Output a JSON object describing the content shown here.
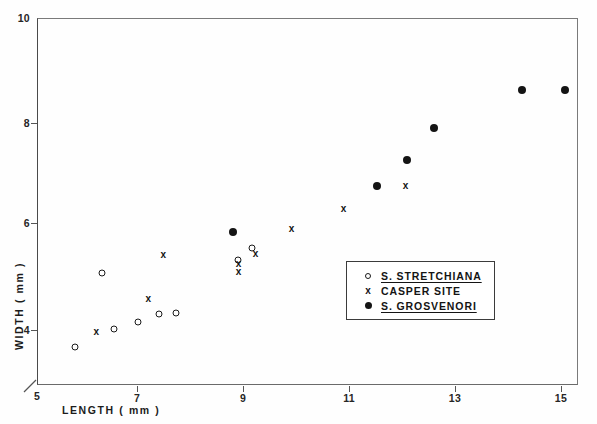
{
  "chart_data": {
    "type": "scatter",
    "title": "",
    "xlabel": "LENGTH ( mm )",
    "ylabel": "WIDTH ( mm )",
    "xlim": [
      5,
      15.2
    ],
    "ylim": [
      3.15,
      10
    ],
    "xticks": [
      5,
      7,
      9,
      11,
      13,
      15
    ],
    "yticks": [
      4,
      6,
      8,
      10
    ],
    "xtick_labels": [
      "5",
      "7",
      "9",
      "11",
      "13",
      "15"
    ],
    "ytick_labels": [
      "4",
      "6",
      "8",
      "10"
    ],
    "grid": false,
    "legend_position": "center-right",
    "series": [
      {
        "name": "S. STRETCHIANA",
        "marker": "open-circle",
        "underline": true,
        "points": [
          [
            5.72,
            3.86
          ],
          [
            6.22,
            5.25
          ],
          [
            6.45,
            4.2
          ],
          [
            6.9,
            4.32
          ],
          [
            7.3,
            4.48
          ],
          [
            7.62,
            4.5
          ],
          [
            8.78,
            5.48
          ],
          [
            9.05,
            5.7
          ]
        ]
      },
      {
        "name": "CASPER SITE",
        "marker": "cross",
        "underline": false,
        "points": [
          [
            6.12,
            4.15
          ],
          [
            7.38,
            5.6
          ],
          [
            7.1,
            4.78
          ],
          [
            8.8,
            5.42
          ],
          [
            8.8,
            5.28
          ],
          [
            9.12,
            5.62
          ],
          [
            9.8,
            6.08
          ],
          [
            10.78,
            6.45
          ],
          [
            11.95,
            6.88
          ]
        ]
      },
      {
        "name": "S. GROSVENORI",
        "marker": "filled-circle",
        "underline": true,
        "points": [
          [
            8.7,
            6.0
          ],
          [
            11.4,
            6.87
          ],
          [
            11.98,
            7.35
          ],
          [
            12.48,
            7.95
          ],
          [
            14.15,
            8.65
          ],
          [
            14.95,
            8.65
          ]
        ]
      }
    ]
  },
  "legend": {
    "entries": [
      {
        "symbol": "o",
        "label": "S. STRETCHIANA"
      },
      {
        "symbol": "x",
        "label": "CASPER SITE"
      },
      {
        "symbol": "●",
        "label": "S. GROSVENORI"
      }
    ]
  },
  "axis": {
    "origin_label": "5"
  },
  "colors": {
    "ink": "#141414",
    "axis": "#555555",
    "background": "#ffffff"
  }
}
